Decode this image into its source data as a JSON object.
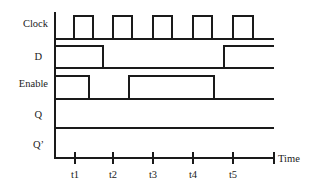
{
  "diagram": {
    "type": "timing-diagram",
    "signals": [
      {
        "name": "Clock",
        "label": "Clock",
        "baseline_y": 39,
        "high_y": 16,
        "segments": [
          [
            55,
            "low"
          ],
          [
            74,
            "high"
          ],
          [
            93,
            "low"
          ],
          [
            113,
            "high"
          ],
          [
            132,
            "low"
          ],
          [
            153,
            "high"
          ],
          [
            172,
            "low"
          ],
          [
            193,
            "high"
          ],
          [
            212,
            "low"
          ],
          [
            233,
            "high"
          ],
          [
            253,
            "low"
          ],
          [
            274,
            "end"
          ]
        ]
      },
      {
        "name": "D",
        "label": "D",
        "baseline_y": 68,
        "high_y": 46,
        "segments": [
          [
            55,
            "high"
          ],
          [
            103,
            "low"
          ],
          [
            224,
            "high"
          ],
          [
            274,
            "end"
          ]
        ]
      },
      {
        "name": "Enable",
        "label": "Enable",
        "baseline_y": 99,
        "high_y": 76,
        "segments": [
          [
            55,
            "high"
          ],
          [
            89,
            "low"
          ],
          [
            129,
            "high"
          ],
          [
            214,
            "low"
          ],
          [
            274,
            "end"
          ]
        ]
      },
      {
        "name": "Q",
        "label": "Q",
        "baseline_y": 128,
        "high_y": 106,
        "segments": [
          [
            55,
            "low"
          ],
          [
            274,
            "end"
          ]
        ]
      },
      {
        "name": "Q'",
        "label": "Q’",
        "baseline_y": 158,
        "high_y": 136,
        "segments": [
          [
            55,
            "low"
          ],
          [
            274,
            "end"
          ]
        ]
      }
    ],
    "time_axis": {
      "label": "Time",
      "y": 158,
      "ticks": [
        {
          "label": "t1",
          "x": 75
        },
        {
          "label": "t2",
          "x": 113
        },
        {
          "label": "t3",
          "x": 153
        },
        {
          "label": "t4",
          "x": 193
        },
        {
          "label": "t5",
          "x": 233
        }
      ],
      "end_x": 274
    },
    "colors": {
      "line": "#1a1a1a",
      "text": "#222222",
      "background": "#ffffff"
    }
  }
}
